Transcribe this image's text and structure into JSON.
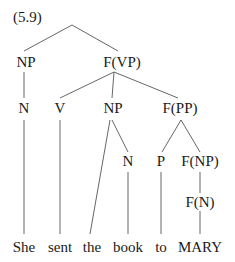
{
  "example_number": "(5.9)",
  "colors": {
    "text": "#1a1a1a",
    "edge": "#555555",
    "background": "#ffffff"
  },
  "nodes": [
    {
      "id": "root",
      "label": "",
      "x": 72,
      "y": 25
    },
    {
      "id": "np1",
      "label": "NP",
      "x": 26,
      "y": 67
    },
    {
      "id": "fvp",
      "label": "F(VP)",
      "x": 122,
      "y": 67
    },
    {
      "id": "n1",
      "label": "N",
      "x": 24,
      "y": 113
    },
    {
      "id": "v",
      "label": "V",
      "x": 60,
      "y": 113
    },
    {
      "id": "np2",
      "label": "NP",
      "x": 113,
      "y": 113
    },
    {
      "id": "fpp",
      "label": "F(PP)",
      "x": 180,
      "y": 113
    },
    {
      "id": "n2",
      "label": "N",
      "x": 128,
      "y": 166
    },
    {
      "id": "p",
      "label": "P",
      "x": 161,
      "y": 166
    },
    {
      "id": "fnp",
      "label": "F(NP)",
      "x": 200,
      "y": 166
    },
    {
      "id": "fn",
      "label": "F(N)",
      "x": 200,
      "y": 207
    }
  ],
  "words": [
    {
      "id": "w-she",
      "label": "She",
      "x": 24,
      "y": 252
    },
    {
      "id": "w-sent",
      "label": "sent",
      "x": 60,
      "y": 252
    },
    {
      "id": "w-the",
      "label": "the",
      "x": 92,
      "y": 252
    },
    {
      "id": "w-book",
      "label": "book",
      "x": 128,
      "y": 252
    },
    {
      "id": "w-to",
      "label": "to",
      "x": 161,
      "y": 252
    },
    {
      "id": "w-mary",
      "label": "MARY",
      "x": 200,
      "y": 252
    }
  ],
  "edges": [
    {
      "from": "root",
      "to": "np1",
      "x1": 72,
      "y1": 25,
      "x2": 24,
      "y2": 51
    },
    {
      "from": "root",
      "to": "fvp",
      "x1": 72,
      "y1": 25,
      "x2": 118,
      "y2": 51
    },
    {
      "from": "np1",
      "to": "n1",
      "x1": 24,
      "y1": 72,
      "x2": 24,
      "y2": 98
    },
    {
      "from": "fvp",
      "to": "v",
      "x1": 114,
      "y1": 72,
      "x2": 60,
      "y2": 98
    },
    {
      "from": "fvp",
      "to": "np2",
      "x1": 114,
      "y1": 72,
      "x2": 112,
      "y2": 98
    },
    {
      "from": "fvp",
      "to": "fpp",
      "x1": 114,
      "y1": 72,
      "x2": 178,
      "y2": 98
    },
    {
      "from": "np2",
      "to": "the",
      "x1": 110,
      "y1": 120,
      "x2": 90,
      "y2": 234
    },
    {
      "from": "np2",
      "to": "n2",
      "x1": 112,
      "y1": 120,
      "x2": 128,
      "y2": 152
    },
    {
      "from": "fpp",
      "to": "p",
      "x1": 181,
      "y1": 120,
      "x2": 162,
      "y2": 152
    },
    {
      "from": "fpp",
      "to": "fnp",
      "x1": 181,
      "y1": 120,
      "x2": 200,
      "y2": 152
    },
    {
      "from": "n1",
      "to": "she",
      "x1": 24,
      "y1": 120,
      "x2": 24,
      "y2": 234
    },
    {
      "from": "v",
      "to": "sent",
      "x1": 60,
      "y1": 120,
      "x2": 60,
      "y2": 234
    },
    {
      "from": "n2",
      "to": "book",
      "x1": 128,
      "y1": 172,
      "x2": 128,
      "y2": 234
    },
    {
      "from": "p",
      "to": "to",
      "x1": 161,
      "y1": 172,
      "x2": 161,
      "y2": 234
    },
    {
      "from": "fnp",
      "to": "fn",
      "x1": 200,
      "y1": 172,
      "x2": 200,
      "y2": 193
    },
    {
      "from": "fn",
      "to": "mary",
      "x1": 200,
      "y1": 211,
      "x2": 200,
      "y2": 234
    }
  ]
}
